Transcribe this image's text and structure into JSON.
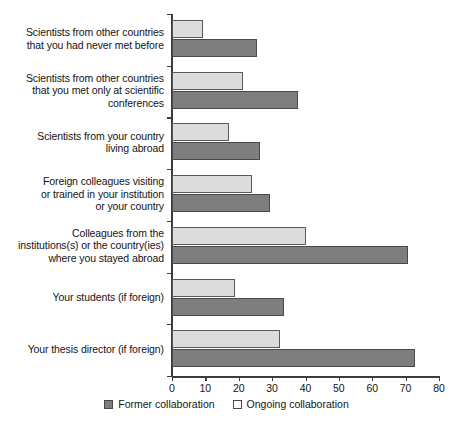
{
  "chart_data": {
    "type": "bar",
    "orientation": "horizontal",
    "title": "",
    "xlabel": "",
    "ylabel": "",
    "xlim": [
      0,
      80
    ],
    "xticks": [
      0,
      10,
      20,
      30,
      40,
      50,
      60,
      70,
      80
    ],
    "grid": false,
    "legend_position": "bottom-center",
    "categories": [
      "Scientists from other countries that you had never met before",
      "Scientists from other countries that you met only at scientific conferences",
      "Scientists from your country living abroad",
      "Foreign colleagues visiting or trained in your institution or your country",
      "Colleagues from the institutions(s) or the country(ies) where you stayed abroad",
      "Your students (if foreign)",
      "Your thesis director (if foreign)"
    ],
    "category_lines": [
      [
        "Scientists from other countries",
        "that you had never met before"
      ],
      [
        "Scientists from other countries",
        "that you met only at scientific",
        "conferences"
      ],
      [
        "Scientists from your country",
        "living abroad"
      ],
      [
        "Foreign colleagues visiting",
        "or trained in your institution",
        "or your country"
      ],
      [
        "Colleagues from the",
        "institutions(s) or the country(ies)",
        "where you stayed abroad"
      ],
      [
        "Your students (if foreign)"
      ],
      [
        "Your thesis director (if foreign)"
      ]
    ],
    "series": [
      {
        "name": "Ongoing collaboration",
        "color": "#dcdcdc",
        "values": [
          9.3,
          21.3,
          17.1,
          24.0,
          40.0,
          19.0,
          32.3
        ]
      },
      {
        "name": "Former collaboration",
        "color": "#7e7e7e",
        "values": [
          25.5,
          37.7,
          26.3,
          29.3,
          70.7,
          33.5,
          72.8
        ]
      }
    ]
  },
  "legend": {
    "entries": [
      {
        "label": "Former collaboration",
        "swatch": "former"
      },
      {
        "label": "Ongoing collaboration",
        "swatch": "ongoing"
      }
    ]
  },
  "colors": {
    "former": "#7e7e7e",
    "ongoing": "#dcdcdc",
    "axis": "#3c3c3c",
    "text": "#141414",
    "background": "#ffffff"
  }
}
